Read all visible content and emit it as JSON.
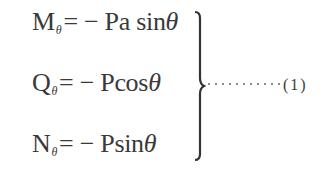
{
  "equations": [
    {
      "symbol": "M",
      "subscript": "θ",
      "rhs_prefix": "= − Pa sin",
      "variable": "θ"
    },
    {
      "symbol": "Q",
      "subscript": "θ",
      "rhs_prefix": "= − Pcos",
      "variable": "θ"
    },
    {
      "symbol": "N",
      "subscript": "θ",
      "rhs_prefix": "= − Psin",
      "variable": "θ"
    }
  ],
  "equation_number": "(1)",
  "leader": "dotted",
  "brace": "right-curly-brace"
}
